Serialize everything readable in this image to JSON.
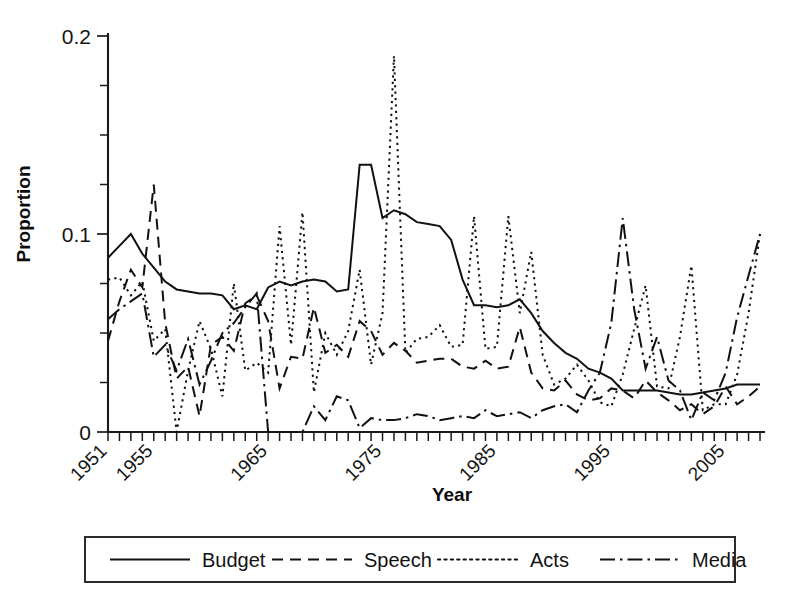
{
  "chart_data": {
    "type": "line",
    "title": "",
    "xlabel": "Year",
    "ylabel": "Proportion",
    "xlim": [
      1951,
      2008
    ],
    "ylim": [
      0,
      0.2
    ],
    "grid": false,
    "legend_position": "below-outside",
    "ytick_labels": [
      "0",
      "0.1",
      "0.2"
    ],
    "ytick_values": [
      0,
      0.1,
      0.2
    ],
    "yminor_step": 0.025,
    "xtick_labels": [
      "1951",
      "1955",
      "1965",
      "1975",
      "1985",
      "1995",
      "2005"
    ],
    "xtick_values": [
      1951,
      1955,
      1965,
      1975,
      1985,
      1995,
      2005
    ],
    "x": [
      1951,
      1952,
      1953,
      1954,
      1955,
      1956,
      1957,
      1958,
      1959,
      1960,
      1961,
      1962,
      1963,
      1964,
      1965,
      1966,
      1967,
      1968,
      1969,
      1970,
      1971,
      1972,
      1973,
      1974,
      1975,
      1976,
      1977,
      1978,
      1979,
      1980,
      1981,
      1982,
      1983,
      1984,
      1985,
      1986,
      1987,
      1988,
      1989,
      1990,
      1991,
      1992,
      1993,
      1994,
      1995,
      1996,
      1997,
      1998,
      1999,
      2000,
      2001,
      2002,
      2003,
      2004,
      2005,
      2006,
      2007,
      2008
    ],
    "series": [
      {
        "name": "Budget",
        "style": "solid",
        "values": [
          0.088,
          0.094,
          0.1,
          0.09,
          0.083,
          0.076,
          0.072,
          0.071,
          0.07,
          0.07,
          0.069,
          0.062,
          0.064,
          0.062,
          0.073,
          0.076,
          0.074,
          0.076,
          0.077,
          0.076,
          0.071,
          0.072,
          0.135,
          0.135,
          0.108,
          0.112,
          0.11,
          0.106,
          0.105,
          0.104,
          0.097,
          0.077,
          0.064,
          0.064,
          0.063,
          0.064,
          0.067,
          0.06,
          0.051,
          0.045,
          0.04,
          0.037,
          0.032,
          0.03,
          0.027,
          0.021,
          0.021,
          0.021,
          0.021,
          0.02,
          0.019,
          0.019,
          0.02,
          0.021,
          0.022,
          0.024,
          0.024,
          0.024
        ]
      },
      {
        "name": "Speech",
        "style": "dashed",
        "values": [
          0.046,
          0.066,
          0.082,
          0.073,
          0.125,
          0.055,
          0.027,
          0.033,
          0.008,
          0.044,
          0.048,
          0.041,
          0.065,
          0.069,
          0.056,
          0.022,
          0.038,
          0.037,
          0.063,
          0.04,
          0.044,
          0.038,
          0.056,
          0.051,
          0.039,
          0.045,
          0.041,
          0.035,
          0.036,
          0.037,
          0.037,
          0.033,
          0.032,
          0.036,
          0.032,
          0.033,
          0.053,
          0.03,
          0.022,
          0.021,
          0.026,
          0.019,
          0.016,
          0.017,
          0.022,
          0.021,
          0.017,
          0.026,
          0.02,
          0.016,
          0.011,
          0.014,
          0.009,
          0.013,
          0.023,
          0.014,
          0.018,
          0.023
        ]
      },
      {
        "name": "Acts",
        "style": "dotted",
        "values": [
          0.077,
          0.078,
          0.069,
          0.076,
          0.046,
          0.052,
          0.0,
          0.031,
          0.056,
          0.042,
          0.018,
          0.075,
          0.031,
          0.035,
          0.03,
          0.104,
          0.044,
          0.111,
          0.02,
          0.05,
          0.039,
          0.051,
          0.082,
          0.034,
          0.06,
          0.19,
          0.04,
          0.047,
          0.048,
          0.054,
          0.043,
          0.044,
          0.109,
          0.042,
          0.043,
          0.109,
          0.06,
          0.091,
          0.039,
          0.024,
          0.027,
          0.034,
          0.026,
          0.015,
          0.013,
          0.029,
          0.052,
          0.074,
          0.023,
          0.022,
          0.048,
          0.084,
          0.011,
          0.014,
          0.014,
          0.029,
          0.06,
          0.1
        ]
      },
      {
        "name": "Media",
        "style": "dashdot",
        "values": [
          0.057,
          0.062,
          0.066,
          0.07,
          0.038,
          0.044,
          0.031,
          0.047,
          0.024,
          0.036,
          0.05,
          0.055,
          0.063,
          0.07,
          0.0,
          0.0,
          0.0,
          0.0,
          0.013,
          0.006,
          0.018,
          0.016,
          0.002,
          0.007,
          0.006,
          0.006,
          0.007,
          0.009,
          0.008,
          0.006,
          0.007,
          0.008,
          0.007,
          0.011,
          0.008,
          0.009,
          0.01,
          0.007,
          0.011,
          0.013,
          0.014,
          0.01,
          0.021,
          0.03,
          0.055,
          0.108,
          0.062,
          0.032,
          0.048,
          0.026,
          0.021,
          0.006,
          0.02,
          0.016,
          0.03,
          0.058,
          0.079,
          0.1
        ]
      }
    ]
  },
  "legend": {
    "items": [
      {
        "label": "Budget",
        "style": "solid"
      },
      {
        "label": "Speech",
        "style": "dashed"
      },
      {
        "label": "Acts",
        "style": "dotted"
      },
      {
        "label": "Media",
        "style": "dashdot"
      }
    ]
  },
  "colors": {
    "line": "#111111",
    "axis": "#1a1a1a",
    "background": "#ffffff"
  }
}
